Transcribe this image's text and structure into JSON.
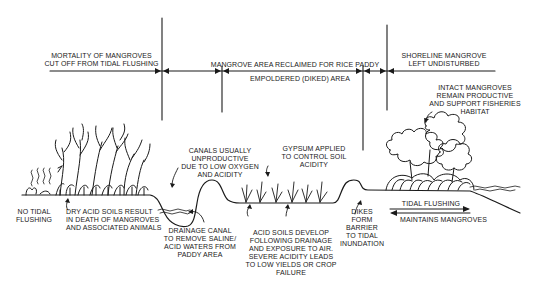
{
  "diagram": {
    "zones": {
      "mortality": "MORTALITY OF MANGROVES\nCUT OFF FROM TIDAL FLUSHING",
      "reclaimed": "MANGROVE AREA RECLAIMED FOR RICE PADDY",
      "empoldered": "EMPOLDERED (DIKED) AREA",
      "shoreline": "SHORELINE MANGROVE\nLEFT UNDISTURBED"
    },
    "annotations": {
      "intact": "INTACT MANGROVES\nREMAIN PRODUCTIVE\nAND SUPPORT FISHERIES\nHABITAT",
      "canals": "CANALS USUALLY\nUNPRODUCTIVE\nDUE TO LOW OXYGEN\nAND ACIDITY",
      "gypsum": "GYPSUM APPLIED\nTO CONTROL SOIL\nACIDITY",
      "no_tidal": "NO TIDAL\nFLUSHING",
      "dry_acid": "DRY ACID SOILS RESULT\nIN DEATH OF MANGROVES\nAND ASSOCIATED ANIMALS",
      "drainage": "DRAINAGE CANAL\nTO REMOVE SALINE/\nACID WATERS FROM\nPADDY AREA",
      "acid_soils": "ACID SOILS DEVELOP\nFOLLOWING DRAINAGE\nAND EXPOSURE TO AIR.\nSEVERE ACIDITY LEADS\nTO LOW YIELDS OR CROP\nFAILURE",
      "dikes": "DIKES\nFORM\nBARRIER\nTO TIDAL\nINUNDATION",
      "tidal_flushing": "TIDAL FLUSHING",
      "maintains": "MAINTAINS MANGROVES"
    },
    "colors": {
      "ink": "#1a1a1a",
      "background": "#ffffff"
    }
  }
}
